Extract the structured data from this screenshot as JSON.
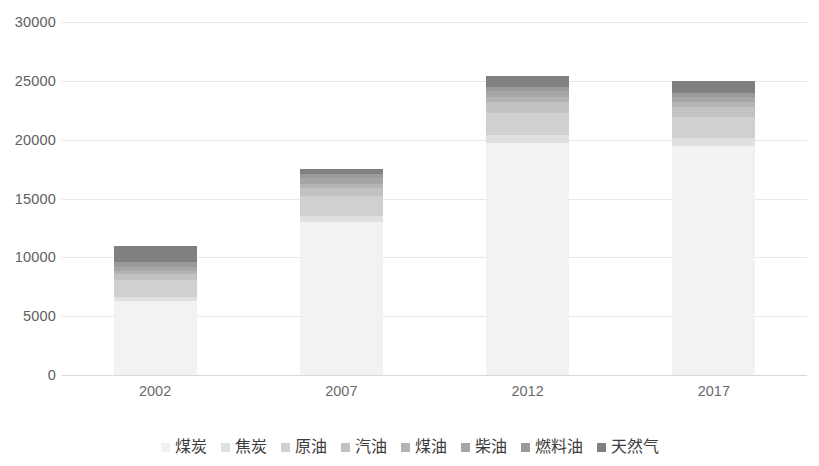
{
  "chart_data": {
    "type": "bar",
    "stacked": true,
    "title": "",
    "subtitle": "",
    "xlabel": "",
    "ylabel": "",
    "categories": [
      "2002",
      "2007",
      "2012",
      "2017"
    ],
    "ylim": [
      0,
      30000
    ],
    "y_ticks": [
      0,
      5000,
      10000,
      15000,
      20000,
      25000,
      30000
    ],
    "y_tick_labels": [
      "0",
      "5000",
      "10000",
      "15000",
      "20000",
      "25000",
      "30000"
    ],
    "grid": true,
    "grid_axis": "y",
    "legend_position": "bottom",
    "series": [
      {
        "name": "煤炭",
        "color": "#f2f2f2",
        "values": [
          6300,
          13000,
          19700,
          19500
        ]
      },
      {
        "name": "焦炭",
        "color": "#e0e0e0",
        "values": [
          300,
          500,
          700,
          600
        ]
      },
      {
        "name": "原油",
        "color": "#d0d0d0",
        "values": [
          1500,
          1700,
          1900,
          1800
        ]
      },
      {
        "name": "汽油",
        "color": "#c2c2c2",
        "values": [
          500,
          700,
          900,
          900
        ]
      },
      {
        "name": "煤油",
        "color": "#b4b4b4",
        "values": [
          200,
          300,
          400,
          400
        ]
      },
      {
        "name": "柴油",
        "color": "#a6a6a6",
        "values": [
          400,
          500,
          500,
          450
        ]
      },
      {
        "name": "燃料油",
        "color": "#9a9a9a",
        "values": [
          400,
          400,
          400,
          350
        ]
      },
      {
        "name": "天然气",
        "color": "#808080",
        "values": [
          1400,
          400,
          900,
          1000
        ]
      }
    ],
    "totals": [
      11000,
      17500,
      25400,
      25000
    ]
  },
  "legend": {
    "items": [
      {
        "label": "煤炭"
      },
      {
        "label": "焦炭"
      },
      {
        "label": "原油"
      },
      {
        "label": "汽油"
      },
      {
        "label": "煤油"
      },
      {
        "label": "柴油"
      },
      {
        "label": "燃料油"
      },
      {
        "label": "天然气"
      }
    ]
  }
}
